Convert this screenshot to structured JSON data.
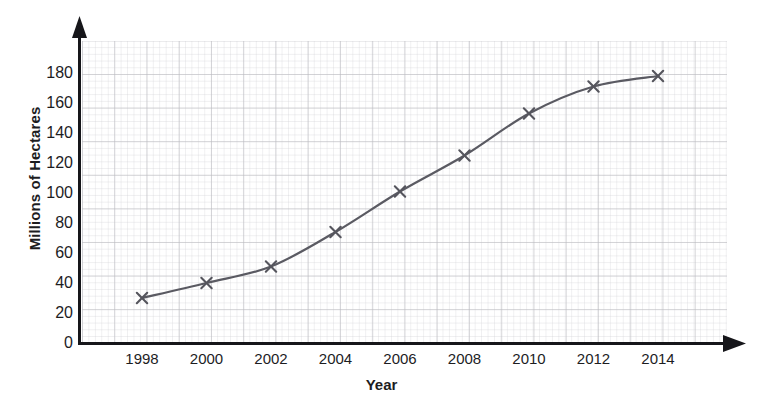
{
  "chart_data": {
    "type": "line",
    "title": "",
    "subtitle": "",
    "xlabel": "Year",
    "ylabel": "Millions of Hectares",
    "x": [
      1998,
      2000,
      2002,
      2004,
      2006,
      2008,
      2010,
      2012,
      2014
    ],
    "categories": [
      "1998",
      "2000",
      "2002",
      "2004",
      "2006",
      "2008",
      "2010",
      "2012",
      "2014"
    ],
    "values": [
      30,
      40,
      51,
      74,
      101,
      125,
      153,
      171,
      178
    ],
    "series": [
      {
        "name": "Millions of Hectares",
        "values": [
          30,
          40,
          51,
          74,
          101,
          125,
          153,
          171,
          178
        ]
      }
    ],
    "xlim": [
      1997,
      2015
    ],
    "ylim": [
      0,
      200
    ],
    "y_ticks": [
      0,
      20,
      40,
      60,
      80,
      100,
      120,
      140,
      160,
      180
    ],
    "x_ticks": [
      1998,
      2000,
      2002,
      2004,
      2006,
      2008,
      2010,
      2012,
      2014
    ],
    "grid": true,
    "grid_style": "graph-paper",
    "legend": false,
    "legend_position": "none",
    "marker": "x",
    "line_color": "#5a5a62",
    "marker_color": "#55555d",
    "grid_color": "#9a9aa2",
    "axis_color": "#1a1a1c",
    "annotations": []
  },
  "axis": {
    "y_title": "Millions of Hectares",
    "x_title": "Year",
    "y_tick_labels": [
      "0",
      "20",
      "40",
      "60",
      "80",
      "100",
      "120",
      "140",
      "160",
      "180"
    ],
    "x_tick_labels": [
      "1998",
      "2000",
      "2002",
      "2004",
      "2006",
      "2008",
      "2010",
      "2012",
      "2014"
    ]
  }
}
